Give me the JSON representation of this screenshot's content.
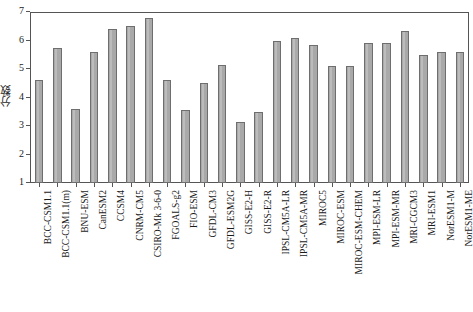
{
  "chart_data": {
    "type": "bar",
    "title": "",
    "subtitle": "",
    "xlabel": "",
    "ylabel": "分数",
    "ylim": [
      1,
      7
    ],
    "yticks": [
      1,
      2,
      3,
      4,
      5,
      6,
      7
    ],
    "ytick_labels": [
      "1",
      "2",
      "3",
      "4",
      "5",
      "6",
      "7"
    ],
    "grid": false,
    "legend": null,
    "legend_position": "none",
    "bar_color": "#a9a9a9",
    "bar_edge_color": "#6e6e6e",
    "axis_color": "#555555",
    "categories": [
      "BCC-CSM1.1",
      "BCC-CSM1.1(m)",
      "BNU-ESM",
      "CanESM2",
      "CCSM4",
      "CNRM-CM5",
      "CSIRO-Mk 3-6-0",
      "FGOALS-g2",
      "FIO-ESM",
      "GFDL-CM3",
      "GFDL-ESM2G",
      "GISS-E2-H",
      "GISS-E2-R",
      "IPSL-CM5A-LR",
      "IPSL-CM5A-MR",
      "MIROC5",
      "MIROC-ESM",
      "MIROC-ESM-CHEM",
      "MPI-ESM-LR",
      "MPI-ESM-MR",
      "MRI-CGCM3",
      "MRI-ESM1",
      "NorESM1-M",
      "NorESM1-ME"
    ],
    "values": [
      4.6,
      5.75,
      3.6,
      5.6,
      6.4,
      6.5,
      6.8,
      4.6,
      3.55,
      4.5,
      5.15,
      3.15,
      3.5,
      6.0,
      6.1,
      5.85,
      5.1,
      5.1,
      5.9,
      5.9,
      6.35,
      5.5,
      5.6,
      5.6
    ]
  },
  "caption": {
    "text": ""
  }
}
